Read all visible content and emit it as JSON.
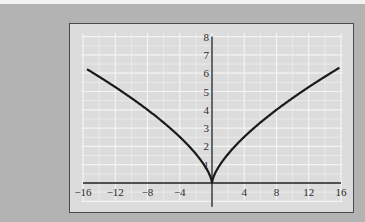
{
  "chart_data": {
    "type": "line",
    "title": "",
    "xlabel": "",
    "ylabel": "",
    "function": "y = x^(2/3)",
    "xlim": [
      -16,
      16
    ],
    "ylim": [
      0,
      8
    ],
    "grid": true,
    "legend": null,
    "x_ticks": [
      -16,
      -12,
      -8,
      -4,
      4,
      8,
      12,
      16
    ],
    "x_tick_labels": [
      "−16",
      "−12",
      "−8",
      "−4",
      "4",
      "8",
      "12",
      "16"
    ],
    "y_ticks": [
      1,
      2,
      3,
      4,
      5,
      6,
      7,
      8
    ],
    "y_tick_labels": [
      "1",
      "2",
      "3",
      "4",
      "5",
      "6",
      "7",
      "8"
    ],
    "series": [
      {
        "name": "y = x^(2/3)",
        "x": [
          -15.5,
          -14,
          -12,
          -10,
          -8,
          -6,
          -4,
          -2,
          -1,
          -0.5,
          0,
          0.5,
          1,
          2,
          4,
          6,
          8,
          10,
          12,
          14,
          15.8
        ],
        "y": [
          6.22,
          5.81,
          5.24,
          4.64,
          4.0,
          3.3,
          2.52,
          1.59,
          1.0,
          0.63,
          0,
          0.63,
          1.0,
          1.59,
          2.52,
          3.3,
          4.0,
          4.64,
          5.24,
          5.81,
          6.3
        ]
      }
    ]
  },
  "colors": {
    "background": "#b3b3b3",
    "panel": "#dcdcdc",
    "grid": "#f4f4f4",
    "axis": "#1e1e1e",
    "curve": "#1a1a1a"
  }
}
